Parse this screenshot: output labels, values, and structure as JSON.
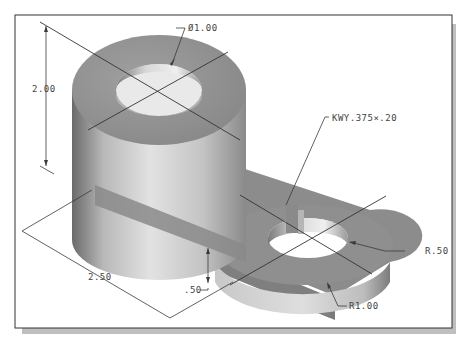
{
  "drawing": {
    "type": "isometric-part-drawing",
    "frame": {
      "border_color": "#333333",
      "shadow_color": "#bcbcbc",
      "background": "#ffffff"
    },
    "colors": {
      "top_face": "#8d8d8d",
      "side_light": "#dcdcdc",
      "side_dark": "#6e6e6e",
      "hole_inner": "#e8e8e8",
      "dimension_line": "#3a3a3a"
    },
    "dimensions": {
      "hole_diameter": "Ø1.00",
      "boss_height": "2.00",
      "keyway": "KWY.375×.20",
      "hole_radius": "R.50",
      "outer_radius": "R1.00",
      "arm_length": "2.50",
      "arm_thickness": ".50"
    }
  }
}
